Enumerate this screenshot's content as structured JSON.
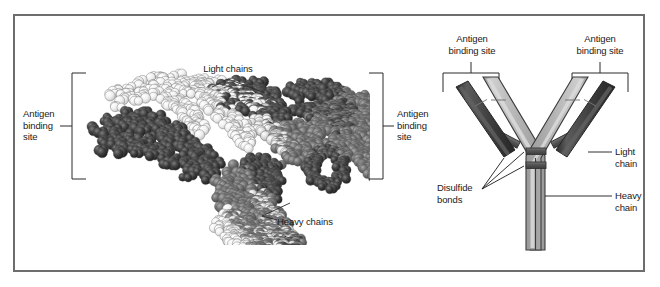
{
  "figure": {
    "border_color": "#6d6d6d",
    "background": "#ffffff"
  },
  "left_panel": {
    "type": "space-filling molecular model",
    "labels": {
      "antigen_binding_site_left": "Antigen\nbinding\nsite",
      "antigen_binding_site_right": "Antigen\nbinding\nsite",
      "light_chains": "Light chains",
      "heavy_chains": "Heavy chains"
    },
    "colors": {
      "dark_sphere": "#3a3a3a",
      "mid_sphere": "#6f6f6f",
      "light_sphere": "#d8d8d8",
      "pale_sphere": "#efefef"
    }
  },
  "right_panel": {
    "type": "schematic Y diagram",
    "labels": {
      "antigen_binding_site_left": "Antigen\nbinding site",
      "antigen_binding_site_right": "Antigen\nbinding site",
      "disulfide_bonds": "Disulfide\nbonds",
      "light_chain": "Light\nchain",
      "heavy_chain": "Heavy\nchain"
    },
    "colors": {
      "heavy_chain": "#b8b8b8",
      "heavy_chain_highlight": "#d9d9d9",
      "heavy_chain_shadow": "#8a8a8a",
      "light_chain": "#3f3f3f",
      "light_chain_highlight": "#5e5e5e",
      "disulfide_bond": "#5a5a5a",
      "outline": "#3c3c3c",
      "leader_line": "#1a1a1a"
    }
  }
}
